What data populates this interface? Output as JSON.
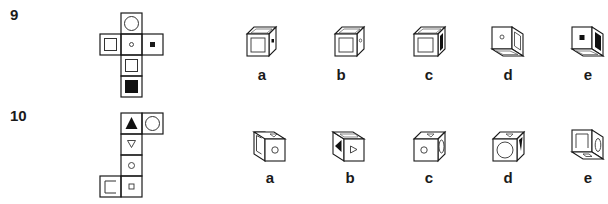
{
  "questions": [
    {
      "number": "9",
      "net": {
        "faces": [
          {
            "position": "top",
            "symbol": "large-circle"
          },
          {
            "position": "left",
            "symbol": "outlined-square"
          },
          {
            "position": "center",
            "symbol": "small-circle"
          },
          {
            "position": "right",
            "symbol": "small-filled-square"
          },
          {
            "position": "below-center",
            "symbol": "outlined-square"
          },
          {
            "position": "bottom",
            "symbol": "large-filled-square"
          }
        ]
      },
      "options": [
        {
          "label": "a",
          "front": "outlined-square",
          "side": "small-filled-square",
          "top": "blank"
        },
        {
          "label": "b",
          "front": "outlined-square",
          "side": "small-circle",
          "top": "blank"
        },
        {
          "label": "c",
          "front": "outlined-square",
          "side": "large-filled-square",
          "top": "blank"
        },
        {
          "label": "d",
          "front": "small-circle",
          "side": "outlined-square",
          "bottom": "blank"
        },
        {
          "label": "e",
          "front": "small-filled-square",
          "side": "large-filled-square",
          "bottom": "blank"
        }
      ]
    },
    {
      "number": "10",
      "net": {
        "faces": [
          {
            "position": "top",
            "symbol": "filled-triangle-up"
          },
          {
            "position": "top-right",
            "symbol": "large-circle"
          },
          {
            "position": "row2",
            "symbol": "outlined-triangle-down"
          },
          {
            "position": "row3",
            "symbol": "small-circle"
          },
          {
            "position": "bottom",
            "symbol": "small-square"
          },
          {
            "position": "bottom-left",
            "symbol": "bracket"
          }
        ]
      },
      "options": [
        {
          "label": "a",
          "front": "small-circle",
          "side": "bracket",
          "top": "triangle"
        },
        {
          "label": "b",
          "front": "outlined-triangle-right",
          "side": "filled-triangle",
          "top": "blank"
        },
        {
          "label": "c",
          "front": "small-circle",
          "side": "large-circle",
          "top": "triangle"
        },
        {
          "label": "d",
          "front": "large-circle",
          "side": "filled-triangle",
          "top": "triangle"
        },
        {
          "label": "e",
          "front": "bracket",
          "side": "large-circle",
          "bottom": "small-square"
        }
      ]
    }
  ]
}
